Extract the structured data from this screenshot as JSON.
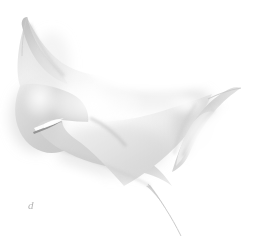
{
  "figure": {
    "label": "d",
    "background_color": "#ffffff",
    "width": 253,
    "height": 251,
    "palette": {
      "background": "#ffffff",
      "highlight": "#ffffff",
      "light_gray": "#f2f2f2",
      "mid_gray": "#d2d2d2",
      "shadow_gray": "#b8b8b8",
      "dark_crease": "#8a8a8a",
      "label_gray": "#b4b4b4"
    },
    "features": [
      {
        "name": "upper-left-cusp-horn",
        "tip": [
          27,
          17
        ]
      },
      {
        "name": "left-rounded-lobe",
        "center": [
          30,
          115
        ]
      },
      {
        "name": "central-crease-spike",
        "from": [
          33,
          131
        ],
        "to": [
          62,
          121
        ]
      },
      {
        "name": "right-folded-lobe",
        "center": [
          196,
          118
        ]
      },
      {
        "name": "right-cusp-tip",
        "tip": [
          241,
          88
        ]
      },
      {
        "name": "lower-tail-spike",
        "from": [
          150,
          185
        ],
        "to": [
          182,
          236
        ]
      }
    ]
  }
}
